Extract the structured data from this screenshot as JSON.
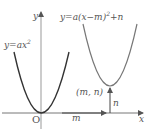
{
  "diagram": {
    "title": "",
    "axes": {
      "x_label": "x",
      "y_label": "y",
      "origin_label": "O"
    },
    "curves": [
      {
        "id": "base-parabola",
        "equation": "y=ax²",
        "label_parts": [
          "y=ax",
          "2"
        ],
        "color": "#333333"
      },
      {
        "id": "shifted-parabola",
        "equation": "y=a(x−m)²+n",
        "label_parts": [
          "y=a(x−m)",
          "2",
          "+n"
        ],
        "color": "#777777"
      }
    ],
    "vertex_label": "(m, n)",
    "horizontal_shift_label": "m",
    "vertical_shift_label": "n"
  }
}
